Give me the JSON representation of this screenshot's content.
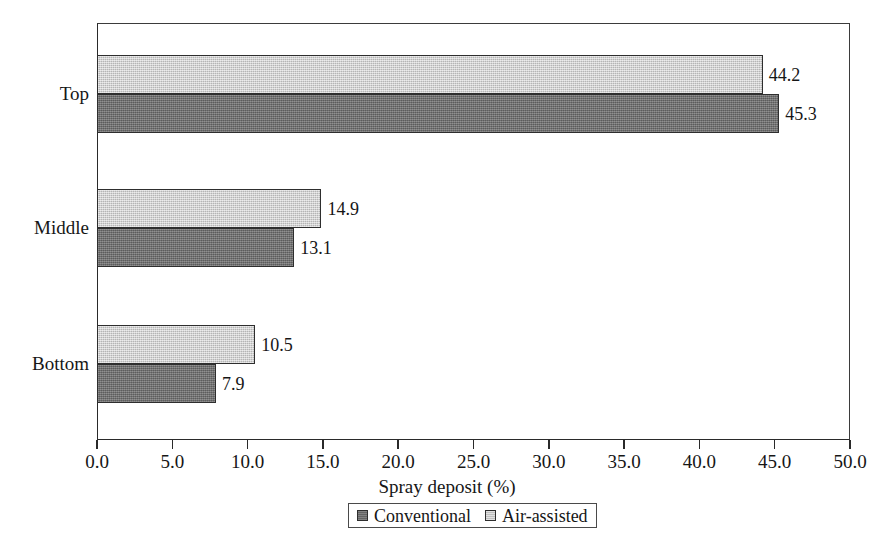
{
  "chart_data": {
    "type": "bar",
    "orientation": "horizontal",
    "title": "",
    "xlabel": "Spray deposit (%)",
    "ylabel": "",
    "xlim": [
      0.0,
      50.0
    ],
    "xticks": [
      "0.0",
      "5.0",
      "10.0",
      "15.0",
      "20.0",
      "25.0",
      "30.0",
      "35.0",
      "40.0",
      "45.0",
      "50.0"
    ],
    "xtick_values": [
      0,
      5,
      10,
      15,
      20,
      25,
      30,
      35,
      40,
      45,
      50
    ],
    "grid": false,
    "legend_position": "bottom-center",
    "categories": [
      "Top",
      "Middle",
      "Bottom"
    ],
    "series": [
      {
        "name": "Conventional",
        "color": "#6f6f6f",
        "values": [
          45.3,
          13.1,
          7.9
        ],
        "labels": [
          "45.3",
          "13.1",
          "7.9"
        ]
      },
      {
        "name": "Air-assisted",
        "color": "#c9c9c9",
        "values": [
          44.2,
          14.9,
          10.5
        ],
        "labels": [
          "44.2",
          "14.9",
          "10.5"
        ]
      }
    ]
  },
  "legend": {
    "entries": [
      {
        "label": "Conventional",
        "swatch": "dark-gray-swatch-icon"
      },
      {
        "label": "Air-assisted",
        "swatch": "light-gray-swatch-icon"
      }
    ]
  }
}
